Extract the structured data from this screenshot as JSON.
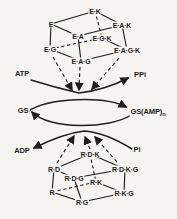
{
  "colors": {
    "ink": "#1e1e1e",
    "background": "#f5f4f1"
  },
  "top_cube": {
    "e": "E",
    "ek": "E·K",
    "eak": "E·A·K",
    "ea": "E·A",
    "egk": "E·G·K",
    "eg": "E·G",
    "eagk": "E·A·G·K",
    "eag": "E·A·G"
  },
  "cycle": {
    "atp": "ATP",
    "ppi": "PPi",
    "gs": "GS",
    "gs_amp_main": "GS(AMP)",
    "gs_amp_sub": "n",
    "adp": "ADP",
    "pi": "Pi"
  },
  "bottom_cube": {
    "rdk": "R·D·K",
    "rd": "R·D",
    "rdkg": "R·D·K·G",
    "rdg": "R·D·G",
    "rk": "R·K",
    "r": "R",
    "rkg": "R·K·G",
    "rg": "R·G"
  }
}
